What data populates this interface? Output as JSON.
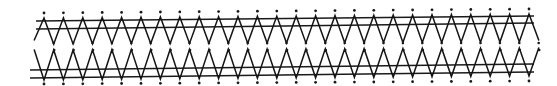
{
  "diagram": {
    "title": "",
    "colors": {
      "ink": "#1a1a1a",
      "background": "#ffffff"
    },
    "geometry": {
      "x_start": 44,
      "pitch": 19.4,
      "count": 26,
      "rails": {
        "top": [
          {
            "x1": 36,
            "y1": 21,
            "x2": 534,
            "y2": 16
          },
          {
            "x1": 36,
            "y1": 29,
            "x2": 534,
            "y2": 23
          }
        ],
        "bottom": [
          {
            "x1": 30,
            "y1": 70,
            "x2": 534,
            "y2": 64
          },
          {
            "x1": 30,
            "y1": 78,
            "x2": 534,
            "y2": 72
          }
        ]
      },
      "upper_zigzag": {
        "peak_y_left": 18,
        "peak_y_right": 14,
        "valley_y_left": 44,
        "valley_y_right": 42
      },
      "lower_zigzag": {
        "peak_y_left": 50,
        "peak_y_right": 48,
        "valley_y_left": 80,
        "valley_y_right": 76
      },
      "dots": {
        "top_y_left": 13,
        "top_y_right": 9,
        "mid_upper_y": 43,
        "mid_lower_y": 50,
        "bottom_y_left": 84,
        "bottom_y_right": 81
      }
    }
  }
}
